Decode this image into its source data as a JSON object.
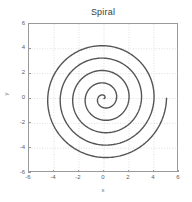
{
  "chart_data": {
    "type": "line",
    "title": "Spiral",
    "xlabel": "x",
    "ylabel": "y",
    "xlim": [
      -6,
      6
    ],
    "ylim": [
      -6,
      6
    ],
    "xticks": [
      -6,
      -4,
      -2,
      0,
      2,
      4,
      6
    ],
    "yticks": [
      -6,
      -4,
      -2,
      0,
      2,
      4,
      6
    ],
    "xticklabels": [
      "-6",
      "-4",
      "-2",
      "0",
      "2",
      "4",
      "6"
    ],
    "yticklabels": [
      "-6",
      "-4",
      "-2",
      "0",
      "2",
      "4",
      "6"
    ],
    "grid": true,
    "grid_style": "dotted",
    "grid_color": "#c8c8c8",
    "axis_color": "#9a9a9a",
    "background_color": "#ffffff",
    "legend": null,
    "series": [
      {
        "name": "Archimedean spiral",
        "color": "#555555",
        "linewidth": 1.4,
        "description": "r = a*theta, starts at origin, ~5 turns, ends near (5, 0)",
        "parametric": {
          "r_of_theta_coefficient": 0.1592,
          "theta_start": 0,
          "theta_end": 31.42,
          "theta_units": "radians",
          "r_max": 5.0,
          "turns": 5
        },
        "extremes": {
          "top": [
            0,
            4.2
          ],
          "bottom": [
            0,
            -4.75
          ],
          "left": [
            -4.4,
            0
          ],
          "right": [
            5.0,
            0
          ]
        }
      }
    ]
  }
}
